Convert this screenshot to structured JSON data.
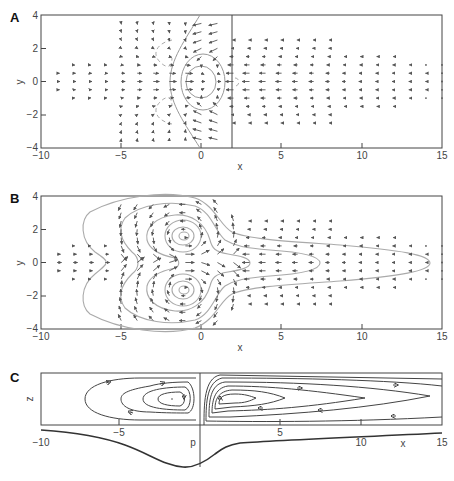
{
  "figure": {
    "panels": [
      {
        "letter": "A",
        "xlabel": "x",
        "ylabel": "y"
      },
      {
        "letter": "B",
        "xlabel": "x",
        "ylabel": "y"
      },
      {
        "letter": "C",
        "xlabel": "x",
        "ylabel": "z",
        "curve_label": "p"
      }
    ]
  },
  "chart_data": [
    {
      "type": "quiver",
      "title": "A",
      "xlabel": "x",
      "ylabel": "y",
      "xlim": [
        -10,
        15
      ],
      "ylim": [
        -4,
        4
      ],
      "xticks": [
        -10,
        -5,
        0,
        5,
        10,
        15
      ],
      "yticks": [
        -4,
        -2,
        0,
        2,
        4
      ],
      "grid": false,
      "annotations": [
        "vertical line at x≈2",
        "closed streamlines around origin (x≈0, y≈0)",
        "dashed recirculation lobes near x≈-2.5, y≈±2",
        "curved separatrix from (0,4) to (0,-4) via x≈-2"
      ],
      "description": "Velocity vector field: inflow arrows pointing +x for x<0 converging toward origin, arrows pointing -x for x>2 decreasing in magnitude with x"
    },
    {
      "type": "quiver",
      "title": "B",
      "xlabel": "x",
      "ylabel": "y",
      "xlim": [
        -10,
        15
      ],
      "ylim": [
        -4,
        4
      ],
      "xticks": [
        -10,
        -5,
        0,
        5,
        10,
        15
      ],
      "yticks": [
        -4,
        -2,
        0,
        2,
        4
      ],
      "grid": false,
      "annotations": [
        "vortex centers at (-1, 1.6) and (-1, -1.6)",
        "nested streamline contours extending to x≈14.5"
      ],
      "description": "Velocity vector field with paired counter-rotating vortices and elongated streamlines downstream"
    },
    {
      "type": "line",
      "title": "C",
      "xlabel": "x",
      "ylabel": "z",
      "xlim": [
        -10,
        15
      ],
      "xticks": [
        -10,
        -5,
        0,
        5,
        10,
        15
      ],
      "grid": false,
      "series": [
        {
          "name": "p",
          "x": [
            -10,
            -7.5,
            -5,
            -3,
            -1,
            0,
            1,
            3,
            6,
            10,
            15
          ],
          "y": [
            -0.05,
            -0.12,
            -0.35,
            -0.7,
            -0.85,
            -0.7,
            -0.35,
            -0.15,
            -0.08,
            -0.04,
            0.0
          ]
        }
      ],
      "annotations": [
        "vertical line at x=0",
        "closed circulation cell centered x≈-1.2",
        "closed circulation cell centered x≈1.5 elongated to x≈14"
      ]
    }
  ]
}
